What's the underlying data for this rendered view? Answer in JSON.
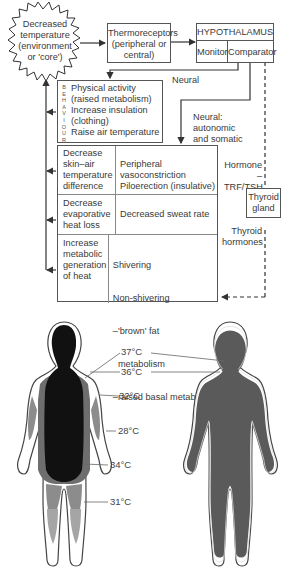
{
  "diagram": {
    "stimulus": {
      "lines": [
        "Decreased",
        "temperature",
        "(environment",
        "or 'core')"
      ]
    },
    "thermoreceptors": {
      "lines": [
        "Thermoreceptors",
        "(peripheral or",
        "central)"
      ]
    },
    "hypothalamus": {
      "title": "HYPOTHALAMUS",
      "monitor": "Monitor",
      "comparator": "Comparator"
    },
    "labels": {
      "neural": "Neural",
      "neural_auto": [
        "Neural:",
        "autonomic",
        "and somatic"
      ],
      "hormone": [
        "Hormone",
        "–TRF/TSH"
      ],
      "thyroid_hormones": [
        "Thyroid",
        "hormones"
      ]
    },
    "thyroid_gland": {
      "lines": [
        "Thyroid",
        "gland"
      ]
    },
    "behaviour": {
      "vertical_label": [
        "B",
        "E",
        "H",
        "A",
        "V",
        "I",
        "O",
        "U",
        "R"
      ],
      "lines": [
        "Physical activity",
        "(raised metabolism)",
        "Increase insulation",
        "(clothing)",
        "Raise air temperature"
      ]
    },
    "responses": [
      {
        "goal": [
          "Decrease",
          "skin–air",
          "temperature",
          "difference"
        ],
        "mechanism": [
          "Peripheral vasoconstriction",
          "Piloerection (insulative)"
        ]
      },
      {
        "goal": [
          "Decrease",
          "evaporative",
          "heat loss"
        ],
        "mechanism": [
          "Decreased sweat rate"
        ]
      },
      {
        "goal": [
          "Increase",
          "metabolic",
          "generation",
          "of heat"
        ],
        "mechanism": [
          "Shivering",
          "Non-shivering",
          "–'brown' fat",
          "  metabolism",
          "–raised basal metabolism"
        ]
      }
    ]
  },
  "body_figures": {
    "temperature_labels": [
      "37°C",
      "36°C",
      "32°C",
      "28°C",
      "34°C",
      "31°C"
    ],
    "colors": {
      "core": "#111111",
      "zone36": "#6e6e6e",
      "zone32": "#8c8c8c",
      "zone31": "#a5a5a5",
      "skin": "#ffffff",
      "warm_body": "#5a5a5a"
    }
  }
}
